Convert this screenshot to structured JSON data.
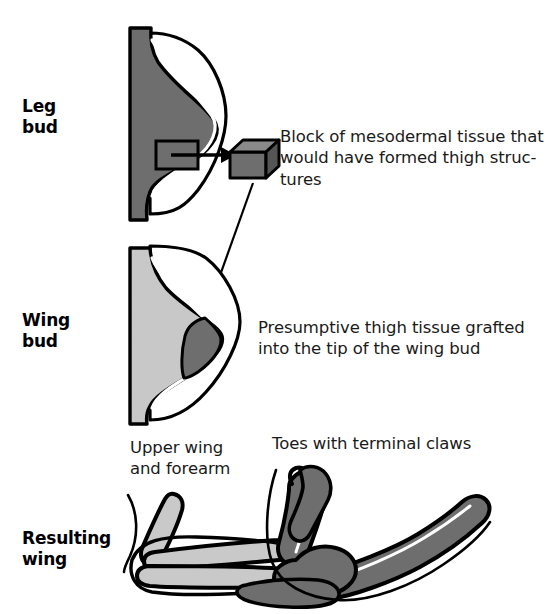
{
  "figure": {
    "width": 556,
    "height": 614
  },
  "stages": [
    {
      "id": "leg-bud",
      "label": "Leg\nbud"
    },
    {
      "id": "wing-bud",
      "label": "Wing\nbud"
    },
    {
      "id": "resulting-wing",
      "label": "Resulting\nwing"
    }
  ],
  "captions": {
    "block": "Block of mesodermal tissue that\nwould have formed thigh struc-\ntures",
    "graft": "Presumptive thigh tissue grafted\ninto the tip of the wing bud"
  },
  "annotations": {
    "upper_wing": "Upper wing\nand forearm",
    "toes": "Toes with terminal claws"
  },
  "colors": {
    "leg_bud_fill": "#6e6e6e",
    "wing_bud_fill": "#c8c8c8",
    "graft_fill": "#6e6e6e",
    "cube_top": "#888888",
    "cube_front": "#6e6e6e",
    "cube_side": "#555555",
    "outline": "#000000",
    "ridge": "#ffffff",
    "background": "#ffffff",
    "text": "#1a1a1a"
  },
  "icons": {
    "donor_site": "square-outline-icon",
    "tissue_block": "cube-icon",
    "transfer_arrow": "arrow-right-icon",
    "graft_arrow": "arrow-diagonal-down-left-icon"
  }
}
